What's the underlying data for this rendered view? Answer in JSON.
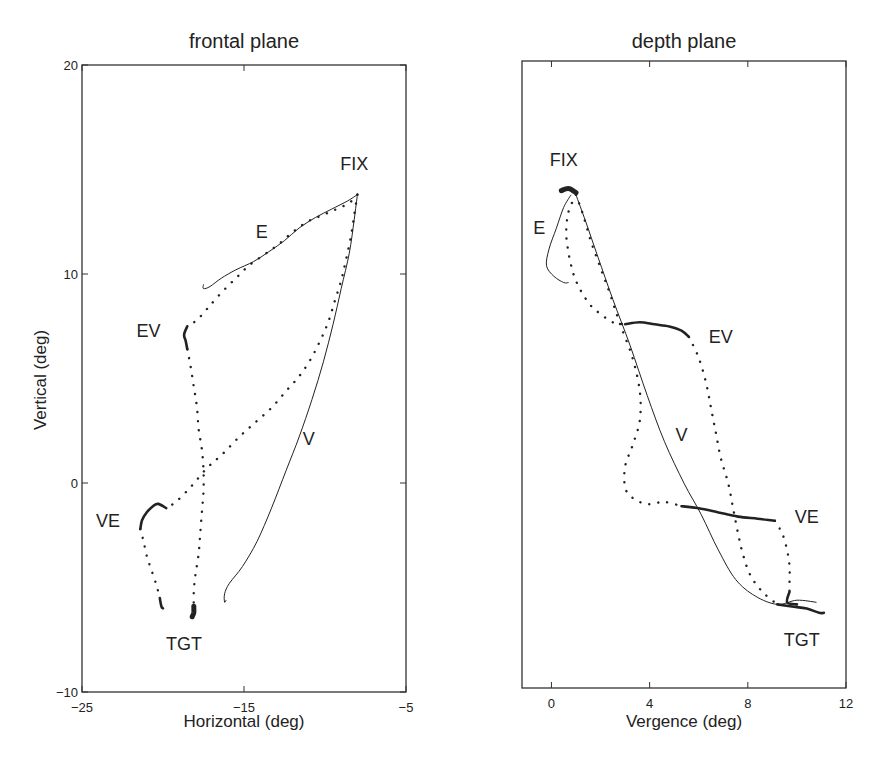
{
  "chart_data": [
    {
      "id": "frontal",
      "type": "line",
      "title": "frontal plane",
      "xlabel": "Horizontal (deg)",
      "ylabel": "Vertical (deg)",
      "xlim": [
        -25,
        -5
      ],
      "ylim": [
        -10,
        20
      ],
      "xticks": [
        -25,
        -15,
        -5
      ],
      "yticks": [
        -10,
        0,
        10,
        20
      ],
      "xtick_labels": [
        "-25",
        "-15",
        "-5"
      ],
      "ytick_labels": [
        "-10",
        "0",
        "10",
        "20"
      ],
      "grid": false,
      "legend": null,
      "box_px": {
        "left": 82,
        "top": 65,
        "right": 406,
        "bottom": 692
      },
      "annotations": [
        {
          "text": "FIX",
          "x": -8.2,
          "y": 15.0
        },
        {
          "text": "E",
          "x": -13.9,
          "y": 11.7
        },
        {
          "text": "EV",
          "x": -20.9,
          "y": 7.0
        },
        {
          "text": "V",
          "x": -11.0,
          "y": 1.8
        },
        {
          "text": "VE",
          "x": -23.4,
          "y": -2.1
        },
        {
          "text": "TGT",
          "x": -18.7,
          "y": -8.0
        }
      ],
      "series": [
        {
          "name": "E (solid)",
          "style": "solid",
          "points": [
            [
              -8.0,
              13.8
            ],
            [
              -8.6,
              13.5
            ],
            [
              -9.6,
              13.1
            ],
            [
              -10.6,
              12.7
            ],
            [
              -11.6,
              12.2
            ],
            [
              -12.5,
              11.6
            ],
            [
              -13.4,
              11.1
            ],
            [
              -14.4,
              10.6
            ],
            [
              -15.5,
              10.2
            ],
            [
              -16.4,
              9.8
            ],
            [
              -17.1,
              9.4
            ],
            [
              -17.5,
              9.3
            ],
            [
              -17.5,
              9.5
            ]
          ]
        },
        {
          "name": "E (dotted)",
          "style": "dotted",
          "points": [
            [
              -8.0,
              13.8
            ],
            [
              -8.5,
              13.4
            ],
            [
              -9.3,
              13.1
            ],
            [
              -10.2,
              12.8
            ],
            [
              -11.1,
              12.5
            ],
            [
              -12.0,
              12.0
            ],
            [
              -12.9,
              11.4
            ],
            [
              -13.8,
              10.9
            ],
            [
              -14.7,
              10.4
            ],
            [
              -15.5,
              9.8
            ],
            [
              -16.4,
              9.1
            ],
            [
              -17.2,
              8.4
            ],
            [
              -17.9,
              7.8
            ],
            [
              -18.5,
              7.5
            ]
          ]
        },
        {
          "name": "EV (dense)",
          "style": "thick",
          "points": [
            [
              -18.5,
              7.5
            ],
            [
              -18.7,
              7.1
            ],
            [
              -18.6,
              6.8
            ],
            [
              -18.5,
              6.4
            ]
          ]
        },
        {
          "name": "EV (dotted)",
          "style": "dotted",
          "points": [
            [
              -18.5,
              6.4
            ],
            [
              -18.3,
              5.6
            ],
            [
              -18.1,
              4.6
            ],
            [
              -17.9,
              3.6
            ],
            [
              -17.8,
              2.6
            ],
            [
              -17.6,
              1.6
            ],
            [
              -17.5,
              0.6
            ],
            [
              -17.5,
              -0.4
            ],
            [
              -17.6,
              -1.4
            ],
            [
              -17.7,
              -2.4
            ],
            [
              -17.8,
              -3.4
            ],
            [
              -18.0,
              -4.4
            ],
            [
              -18.1,
              -5.2
            ],
            [
              -18.1,
              -5.9
            ]
          ]
        },
        {
          "name": "TGT endpoint",
          "style": "blob",
          "points": [
            [
              -18.1,
              -5.9
            ],
            [
              -18.1,
              -6.2
            ],
            [
              -18.2,
              -6.4
            ]
          ]
        },
        {
          "name": "V (solid)",
          "style": "solid",
          "points": [
            [
              -8.0,
              13.8
            ],
            [
              -8.2,
              12.6
            ],
            [
              -8.5,
              11.0
            ],
            [
              -9.0,
              9.3
            ],
            [
              -9.5,
              7.6
            ],
            [
              -10.1,
              5.8
            ],
            [
              -10.8,
              4.0
            ],
            [
              -11.6,
              2.2
            ],
            [
              -12.4,
              0.6
            ],
            [
              -13.3,
              -1.2
            ],
            [
              -14.2,
              -2.8
            ],
            [
              -15.1,
              -4.0
            ],
            [
              -15.9,
              -4.8
            ],
            [
              -16.2,
              -5.3
            ],
            [
              -16.2,
              -5.7
            ],
            [
              -16.1,
              -5.6
            ]
          ]
        },
        {
          "name": "V (dotted)",
          "style": "dotted",
          "points": [
            [
              -8.0,
              13.8
            ],
            [
              -8.2,
              12.8
            ],
            [
              -8.4,
              11.8
            ],
            [
              -8.7,
              10.7
            ],
            [
              -9.0,
              9.7
            ],
            [
              -9.4,
              8.7
            ],
            [
              -9.8,
              7.7
            ],
            [
              -10.3,
              6.8
            ],
            [
              -10.9,
              5.9
            ],
            [
              -11.6,
              5.1
            ],
            [
              -12.4,
              4.4
            ],
            [
              -13.3,
              3.6
            ],
            [
              -14.3,
              2.9
            ],
            [
              -15.3,
              2.2
            ],
            [
              -16.3,
              1.4
            ],
            [
              -17.3,
              0.7
            ],
            [
              -18.3,
              -0.2
            ],
            [
              -19.2,
              -0.9
            ],
            [
              -19.8,
              -1.2
            ]
          ]
        },
        {
          "name": "VE (dense)",
          "style": "thick",
          "points": [
            [
              -19.8,
              -1.2
            ],
            [
              -20.3,
              -1.0
            ],
            [
              -20.6,
              -1.1
            ],
            [
              -21.0,
              -1.4
            ],
            [
              -21.3,
              -1.8
            ],
            [
              -21.4,
              -2.2
            ]
          ]
        },
        {
          "name": "VE (dotted)",
          "style": "dotted",
          "points": [
            [
              -21.4,
              -2.2
            ],
            [
              -21.2,
              -2.8
            ],
            [
              -21.0,
              -3.5
            ],
            [
              -20.7,
              -4.2
            ],
            [
              -20.4,
              -4.9
            ],
            [
              -20.2,
              -5.5
            ]
          ]
        },
        {
          "name": "VE endpoint",
          "style": "thick",
          "points": [
            [
              -20.2,
              -5.5
            ],
            [
              -20.1,
              -5.9
            ],
            [
              -20.0,
              -6.0
            ]
          ]
        }
      ]
    },
    {
      "id": "depth",
      "type": "line",
      "title": "depth plane",
      "xlabel": "Vergence (deg)",
      "ylabel": "",
      "xlim": [
        -1.2,
        12
      ],
      "ylim": [
        -10,
        20
      ],
      "xticks": [
        0,
        4,
        8,
        12
      ],
      "yticks": [],
      "xtick_labels": [
        "0",
        "4",
        "8",
        "12"
      ],
      "ytick_labels": [],
      "grid": false,
      "legend": null,
      "box_px": {
        "left": 522,
        "top": 61,
        "right": 846,
        "bottom": 688
      },
      "annotations": [
        {
          "text": "FIX",
          "x": 0.5,
          "y": 15.0
        },
        {
          "text": "E",
          "x": -0.5,
          "y": 11.7
        },
        {
          "text": "EV",
          "x": 6.9,
          "y": 6.5
        },
        {
          "text": "V",
          "x": 5.3,
          "y": 1.8
        },
        {
          "text": "VE",
          "x": 10.4,
          "y": -2.1
        },
        {
          "text": "TGT",
          "x": 10.2,
          "y": -8.0
        }
      ],
      "series": [
        {
          "name": "FIX endpoint",
          "style": "blob",
          "points": [
            [
              0.4,
              13.8
            ],
            [
              0.7,
              13.9
            ],
            [
              1.0,
              13.7
            ]
          ]
        },
        {
          "name": "E (solid)",
          "style": "solid",
          "points": [
            [
              0.8,
              13.6
            ],
            [
              0.5,
              13.0
            ],
            [
              0.2,
              12.0
            ],
            [
              -0.1,
              11.0
            ],
            [
              -0.2,
              10.2
            ],
            [
              0.1,
              9.7
            ],
            [
              0.5,
              9.4
            ],
            [
              0.7,
              9.4
            ]
          ]
        },
        {
          "name": "E (dotted)",
          "style": "dotted",
          "points": [
            [
              1.0,
              13.6
            ],
            [
              0.7,
              12.8
            ],
            [
              0.6,
              11.8
            ],
            [
              0.7,
              10.8
            ],
            [
              0.9,
              9.8
            ],
            [
              1.2,
              9.0
            ],
            [
              1.6,
              8.3
            ],
            [
              2.0,
              7.9
            ],
            [
              2.5,
              7.5
            ],
            [
              3.0,
              7.4
            ]
          ]
        },
        {
          "name": "EV (dense)",
          "style": "thick",
          "points": [
            [
              3.0,
              7.4
            ],
            [
              3.6,
              7.5
            ],
            [
              4.2,
              7.4
            ],
            [
              4.8,
              7.3
            ],
            [
              5.3,
              7.1
            ],
            [
              5.6,
              6.8
            ]
          ]
        },
        {
          "name": "EV (dotted)",
          "style": "dotted",
          "points": [
            [
              5.6,
              6.8
            ],
            [
              6.0,
              5.8
            ],
            [
              6.3,
              4.6
            ],
            [
              6.5,
              3.4
            ],
            [
              6.7,
              2.2
            ],
            [
              6.9,
              1.0
            ],
            [
              7.2,
              -0.2
            ],
            [
              7.4,
              -1.4
            ],
            [
              7.6,
              -2.6
            ],
            [
              7.8,
              -3.6
            ],
            [
              8.1,
              -4.6
            ],
            [
              8.6,
              -5.4
            ],
            [
              9.2,
              -6.0
            ]
          ]
        },
        {
          "name": "TGT endpoint",
          "style": "thick",
          "points": [
            [
              9.2,
              -6.0
            ],
            [
              9.8,
              -6.1
            ],
            [
              10.4,
              -6.2
            ],
            [
              10.9,
              -6.4
            ],
            [
              11.1,
              -6.4
            ]
          ]
        },
        {
          "name": "V (solid)",
          "style": "solid",
          "points": [
            [
              1.0,
              13.6
            ],
            [
              1.4,
              12.3
            ],
            [
              1.9,
              10.6
            ],
            [
              2.5,
              8.6
            ],
            [
              3.2,
              6.4
            ],
            [
              3.9,
              4.0
            ],
            [
              4.6,
              1.8
            ],
            [
              5.4,
              -0.2
            ],
            [
              6.1,
              -1.7
            ],
            [
              6.8,
              -3.4
            ],
            [
              7.5,
              -4.8
            ],
            [
              8.3,
              -5.6
            ],
            [
              9.2,
              -6.0
            ],
            [
              10.0,
              -5.8
            ],
            [
              10.8,
              -5.9
            ]
          ]
        },
        {
          "name": "V (dotted)",
          "style": "dotted",
          "points": [
            [
              1.0,
              13.6
            ],
            [
              1.3,
              12.6
            ],
            [
              1.6,
              11.4
            ],
            [
              2.0,
              10.1
            ],
            [
              2.4,
              8.8
            ],
            [
              2.8,
              7.4
            ],
            [
              3.3,
              5.8
            ],
            [
              3.6,
              4.2
            ],
            [
              3.6,
              2.8
            ],
            [
              3.3,
              1.6
            ],
            [
              3.0,
              0.6
            ],
            [
              3.0,
              -0.4
            ],
            [
              3.3,
              -0.9
            ],
            [
              3.9,
              -1.2
            ],
            [
              4.6,
              -1.1
            ],
            [
              5.3,
              -1.3
            ]
          ]
        },
        {
          "name": "VE (dense)",
          "style": "thick",
          "points": [
            [
              5.3,
              -1.3
            ],
            [
              6.0,
              -1.4
            ],
            [
              6.8,
              -1.6
            ],
            [
              7.6,
              -1.8
            ],
            [
              8.4,
              -1.9
            ],
            [
              9.1,
              -2.0
            ]
          ]
        },
        {
          "name": "VE (dotted)",
          "style": "dotted",
          "points": [
            [
              9.1,
              -2.0
            ],
            [
              9.4,
              -2.6
            ],
            [
              9.6,
              -3.4
            ],
            [
              9.7,
              -4.2
            ],
            [
              9.7,
              -5.0
            ],
            [
              9.7,
              -5.6
            ]
          ]
        },
        {
          "name": "VE endpoint",
          "style": "thick",
          "points": [
            [
              9.7,
              -5.4
            ],
            [
              9.6,
              -5.9
            ],
            [
              10.0,
              -6.0
            ]
          ]
        }
      ]
    }
  ]
}
